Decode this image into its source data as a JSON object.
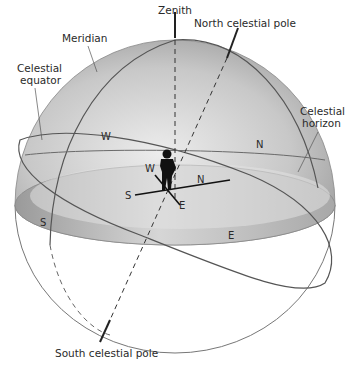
{
  "diagram": {
    "labels": {
      "zenith": "Zenith",
      "north_celestial_pole": "North celestial pole",
      "meridian": "Meridian",
      "celestial_equator_line1": "Celestial",
      "celestial_equator_line2": "equator",
      "celestial_horizon_line1": "Celestial",
      "celestial_horizon_line2": "horizon",
      "south_celestial_pole": "South celestial pole"
    },
    "directions": {
      "equator_west": "W",
      "equator_north": "N",
      "horizon_south": "S",
      "horizon_east": "E",
      "observer_west": "W",
      "observer_north": "N",
      "observer_south": "S",
      "observer_east": "E"
    },
    "colors": {
      "dome_light": "#e6e6e6",
      "dome_dark": "#8f8f8f",
      "line": "#555555",
      "axis": "#222222",
      "background": "#ffffff"
    }
  }
}
